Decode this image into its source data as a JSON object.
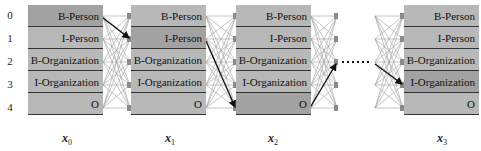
{
  "row_indices": [
    "0",
    "1",
    "2",
    "3",
    "4"
  ],
  "labels": [
    "B-Person",
    "I-Person",
    "B-Organization",
    "I-Organization",
    "O"
  ],
  "columns": [
    {
      "var": "x",
      "sub": "0",
      "selected_row": 0
    },
    {
      "var": "x",
      "sub": "1",
      "selected_row": 1
    },
    {
      "var": "x",
      "sub": "2",
      "selected_row": 4
    },
    {
      "var": "x",
      "sub": "3",
      "selected_row": 3
    }
  ],
  "best_path_transitions": [
    {
      "from_col": 0,
      "from_row": 0,
      "to_row": 1
    },
    {
      "from_col": 1,
      "from_row": 1,
      "to_row": 4
    },
    {
      "from_col": 2,
      "from_row": 4,
      "to_row": 2
    },
    {
      "from_col": "ellipsis",
      "to_row": 3
    }
  ],
  "colors": {
    "cell": "#b8b8b8",
    "cell_selected": "#a2a2a2",
    "border": "#333333",
    "edge": "#9a9a9a",
    "path": "#111111"
  }
}
